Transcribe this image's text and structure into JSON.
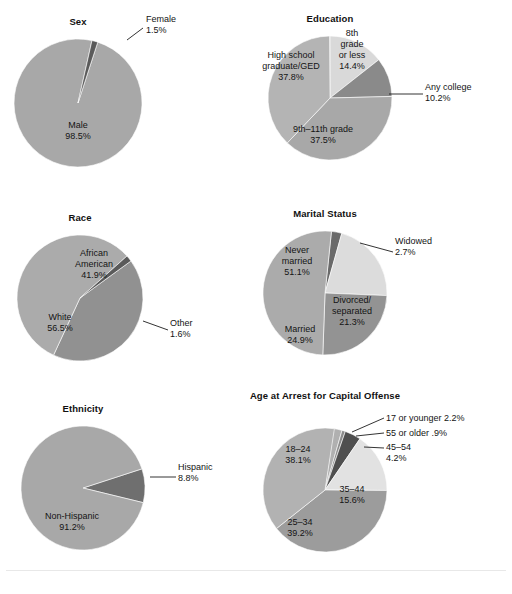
{
  "figure": {
    "background": "#ffffff",
    "grid": {
      "columns": 2,
      "rows": 3
    }
  },
  "palette": {
    "base_gray": "#a8a8a8",
    "mid_gray": "#9a9a9a",
    "dark_gray": "#6e6e6e",
    "darkest_gray": "#4a4a4a",
    "light_gray": "#d9d9d9",
    "lighter_gray": "#e6e6e6",
    "label_color": "#141414",
    "leader_color": "#1d1d1d"
  },
  "chart_data": [
    {
      "type": "pie",
      "id": "sex",
      "title": "Sex",
      "center": [
        78,
        103
      ],
      "radius": 64,
      "start_angle": -72,
      "slices": [
        {
          "label": "Male",
          "percent": 98.5,
          "value_text": "98.5%",
          "color": "#a8a8a8",
          "label_mode": "inside",
          "label_pos": [
            78,
            128
          ],
          "lines": [
            "Male",
            "98.5%"
          ]
        },
        {
          "label": "Female",
          "percent": 1.5,
          "value_text": "1.5%",
          "color": "#5a5a5a",
          "label_mode": "callout",
          "label_pos": [
            146,
            22
          ],
          "lines": [
            "Female",
            "1.5%"
          ],
          "leader": [
            [
              143,
              28
            ],
            [
              127,
              40
            ]
          ]
        }
      ]
    },
    {
      "type": "pie",
      "id": "education",
      "title": "Education",
      "center": [
        330,
        98
      ],
      "radius": 62,
      "start_angle": -90,
      "slices": [
        {
          "label": "8th grade or less",
          "percent": 14.4,
          "value_text": "14.4%",
          "color": "#d9d9d9",
          "label_mode": "inside",
          "label_pos": [
            352,
            36
          ],
          "lines": [
            "8th",
            "grade",
            "or less",
            "14.4%"
          ]
        },
        {
          "label": "Any college",
          "percent": 10.2,
          "value_text": "10.2%",
          "color": "#8a8a8a",
          "label_mode": "callout",
          "label_pos": [
            425,
            90
          ],
          "lines": [
            "Any college",
            "10.2%"
          ],
          "leader": [
            [
              423,
              94
            ],
            [
              389,
              94
            ]
          ]
        },
        {
          "label": "9th–11th grade",
          "percent": 37.5,
          "value_text": "37.5%",
          "color": "#a8a8a8",
          "label_mode": "inside",
          "label_pos": [
            323,
            132
          ],
          "lines": [
            "9th–11th grade",
            "37.5%"
          ]
        },
        {
          "label": "High school graduate/GED",
          "percent": 37.8,
          "value_text": "37.8%",
          "color": "#b4b4b4",
          "label_mode": "inside",
          "label_pos": [
            291,
            58
          ],
          "lines": [
            "High school",
            "graduate/GED",
            "37.8%"
          ]
        }
      ]
    },
    {
      "type": "pie",
      "id": "race",
      "title": "Race",
      "center": [
        80,
        298
      ],
      "radius": 63,
      "start_angle": -36,
      "slices": [
        {
          "label": "African American",
          "percent": 41.9,
          "value_text": "41.9%",
          "color": "#919191",
          "label_mode": "inside",
          "label_pos": [
            94,
            256
          ],
          "lines": [
            "African",
            "American",
            "41.9%"
          ]
        },
        {
          "label": "White",
          "percent": 56.5,
          "value_text": "56.5%",
          "color": "#ababab",
          "label_mode": "inside",
          "label_pos": [
            60,
            320
          ],
          "lines": [
            "White",
            "56.5%"
          ]
        },
        {
          "label": "Other",
          "percent": 1.6,
          "value_text": "1.6%",
          "color": "#5a5a5a",
          "label_mode": "callout",
          "label_pos": [
            170,
            326
          ],
          "lines": [
            "Other",
            "1.6%"
          ],
          "leader": [
            [
              168,
              330
            ],
            [
              143,
              321
            ]
          ]
        }
      ]
    },
    {
      "type": "pie",
      "id": "marital-status",
      "title": "Marital Status",
      "center": [
        325,
        293
      ],
      "radius": 62,
      "start_angle": -84,
      "slices": [
        {
          "label": "Widowed",
          "percent": 2.7,
          "value_text": "2.7%",
          "color": "#6a6a6a",
          "label_mode": "callout",
          "label_pos": [
            395,
            244
          ],
          "lines": [
            "Widowed",
            "2.7%"
          ],
          "leader": [
            [
              393,
              252
            ],
            [
              360,
              243
            ]
          ]
        },
        {
          "label": "Divorced/separated",
          "percent": 21.3,
          "value_text": "21.3%",
          "color": "#dcdcdc",
          "label_mode": "inside",
          "label_pos": [
            352,
            303
          ],
          "lines": [
            "Divorced/",
            "separated",
            "21.3%"
          ]
        },
        {
          "label": "Married",
          "percent": 24.9,
          "value_text": "24.9%",
          "color": "#939393",
          "label_mode": "inside",
          "label_pos": [
            300,
            332
          ],
          "lines": [
            "Married",
            "24.9%"
          ]
        },
        {
          "label": "Never married",
          "percent": 51.1,
          "value_text": "51.1%",
          "color": "#ababab",
          "label_mode": "inside",
          "label_pos": [
            297,
            253
          ],
          "lines": [
            "Never",
            "married",
            "51.1%"
          ]
        }
      ]
    },
    {
      "type": "pie",
      "id": "ethnicity",
      "title": "Ethnicity",
      "center": [
        83,
        488
      ],
      "radius": 62,
      "start_angle": -18,
      "slices": [
        {
          "label": "Hispanic",
          "percent": 8.8,
          "value_text": "8.8%",
          "color": "#6f6f6f",
          "label_mode": "callout",
          "label_pos": [
            178,
            470
          ],
          "lines": [
            "Hispanic",
            "8.8%"
          ],
          "leader": [
            [
              176,
              477
            ],
            [
              150,
              477
            ]
          ]
        },
        {
          "label": "Non-Hispanic",
          "percent": 91.2,
          "value_text": "91.2%",
          "color": "#a8a8a8",
          "label_mode": "inside",
          "label_pos": [
            72,
            519
          ],
          "lines": [
            "Non-Hispanic",
            "91.2%"
          ]
        }
      ]
    },
    {
      "type": "pie",
      "id": "age-at-arrest",
      "title": "Age at Arrest for Capital Offense",
      "center": [
        325,
        490
      ],
      "radius": 62,
      "start_angle": -82,
      "slices": [
        {
          "label": "17 or younger",
          "percent": 2.2,
          "value_text": "2.2%",
          "color": "#b0b0b0",
          "label_mode": "callout",
          "label_pos": [
            386,
            421
          ],
          "lines": [
            "17 or younger 2.2%"
          ],
          "leader": [
            [
              384,
              418
            ],
            [
              352,
              432
            ]
          ]
        },
        {
          "label": "55 or older",
          "percent": 0.9,
          "value_text": ".9%",
          "color": "#8c8c8c",
          "label_mode": "callout",
          "label_pos": [
            386,
            436
          ],
          "lines": [
            "55 or older .9%"
          ],
          "leader": [
            [
              384,
              433
            ],
            [
              356,
              436
            ]
          ]
        },
        {
          "label": "45–54",
          "percent": 4.2,
          "value_text": "4.2%",
          "color": "#4f4f4f",
          "label_mode": "callout",
          "label_pos": [
            386,
            450
          ],
          "lines": [
            "45–54",
            "4.2%"
          ],
          "leader": [
            [
              384,
              448
            ],
            [
              364,
              447
            ]
          ]
        },
        {
          "label": "35–44",
          "percent": 15.6,
          "value_text": "15.6%",
          "color": "#e2e2e2",
          "label_mode": "inside",
          "label_pos": [
            352,
            492
          ],
          "lines": [
            "35–44",
            "15.6%"
          ]
        },
        {
          "label": "25–34",
          "percent": 39.2,
          "value_text": "39.2%",
          "color": "#9c9c9c",
          "label_mode": "inside",
          "label_pos": [
            300,
            525
          ],
          "lines": [
            "25–34",
            "39.2%"
          ]
        },
        {
          "label": "18–24",
          "percent": 38.1,
          "value_text": "38.1%",
          "color": "#b2b2b2",
          "label_mode": "inside",
          "label_pos": [
            298,
            452
          ],
          "lines": [
            "18–24",
            "38.1%"
          ]
        }
      ]
    }
  ],
  "footer": {
    "note": ""
  }
}
